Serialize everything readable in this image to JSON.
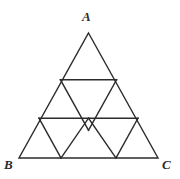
{
  "figure": {
    "kind": "geometry-diagram",
    "background_color": "#ffffff",
    "stroke_color": "#2b2b2b",
    "stroke_width": 1.4,
    "labels": {
      "apex": "A",
      "bottom_left": "B",
      "bottom_right": "C"
    },
    "vertices": {
      "A": {
        "x": 88.5,
        "y": 33
      },
      "B": {
        "x": 19,
        "y": 158
      },
      "C": {
        "x": 158,
        "y": 158
      }
    },
    "outline": "M 88.5 33 L 158 158 L 19 158 Z",
    "interior_segments": [
      {
        "name": "upper-horizontal",
        "x1": 60.4,
        "y1": 79.7,
        "x2": 116.6,
        "y2": 79.7
      },
      {
        "name": "middle-horizontal",
        "x1": 39.0,
        "y1": 118.2,
        "x2": 138.0,
        "y2": 118.2
      },
      {
        "name": "left-parallel-upper",
        "x1": 60.4,
        "y1": 79.7,
        "x2": 88.5,
        "y2": 130.3
      },
      {
        "name": "right-parallel-upper",
        "x1": 116.6,
        "y1": 79.7,
        "x2": 88.5,
        "y2": 130.3
      },
      {
        "name": "left-parallel-lower",
        "x1": 39.0,
        "y1": 118.2,
        "x2": 61.0,
        "y2": 158.0
      },
      {
        "name": "right-parallel-lower",
        "x1": 138.0,
        "y1": 118.2,
        "x2": 116.0,
        "y2": 158.0
      },
      {
        "name": "center-left-down",
        "x1": 88.5,
        "y1": 118.2,
        "x2": 61.0,
        "y2": 158.0
      },
      {
        "name": "center-right-down",
        "x1": 88.5,
        "y1": 118.2,
        "x2": 116.0,
        "y2": 158.0
      }
    ],
    "grid_rows": [
      {
        "row": 1,
        "cells": 1
      },
      {
        "row": 2,
        "cells": 3
      },
      {
        "row": 3,
        "cells": 5
      }
    ]
  }
}
